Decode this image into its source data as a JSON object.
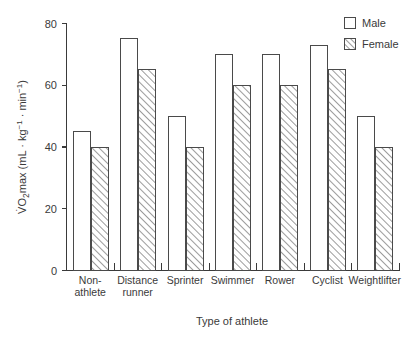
{
  "chart_data": {
    "type": "bar",
    "title": "",
    "xlabel": "Type of athlete",
    "ylabel": "VO2max (mL · kg-1 · min-1)",
    "ylim": [
      0,
      80
    ],
    "yticks": [
      0,
      20,
      40,
      60,
      80
    ],
    "ytick_labels": [
      "0",
      "20",
      "40",
      "60",
      "80"
    ],
    "grid": false,
    "legend_position": "top-right",
    "categories": [
      "Non-athlete",
      "Distance runner",
      "Sprinter",
      "Swimmer",
      "Rower",
      "Cyclist",
      "Weightlifter"
    ],
    "category_lines": [
      [
        "Non-",
        "athlete"
      ],
      [
        "Distance",
        "runner"
      ],
      [
        "Sprinter",
        ""
      ],
      [
        "Swimmer",
        ""
      ],
      [
        "Rower",
        ""
      ],
      [
        "Cyclist",
        ""
      ],
      [
        "Weightlifter",
        ""
      ]
    ],
    "series": [
      {
        "name": "Male",
        "values": [
          45,
          75,
          50,
          70,
          70,
          73,
          50
        ],
        "fill": "white",
        "pattern": "solid"
      },
      {
        "name": "Female",
        "values": [
          40,
          65,
          40,
          60,
          60,
          65,
          40
        ],
        "fill": "white",
        "pattern": "hatch-45"
      }
    ]
  },
  "ylabel_parts": {
    "v_symbol": "V",
    "dot": "̇",
    "o": "O",
    "sub2": "2",
    "max": "max (mL · kg",
    "sup_neg1_a": "−1",
    "mid": " · min",
    "sup_neg1_b": "−1",
    "close": ")"
  },
  "legend": {
    "items": [
      {
        "label": "Male",
        "swatch": "open-square-icon"
      },
      {
        "label": "Female",
        "swatch": "hatched-square-icon"
      }
    ]
  },
  "axis_titles": {
    "x": "Type of athlete"
  }
}
